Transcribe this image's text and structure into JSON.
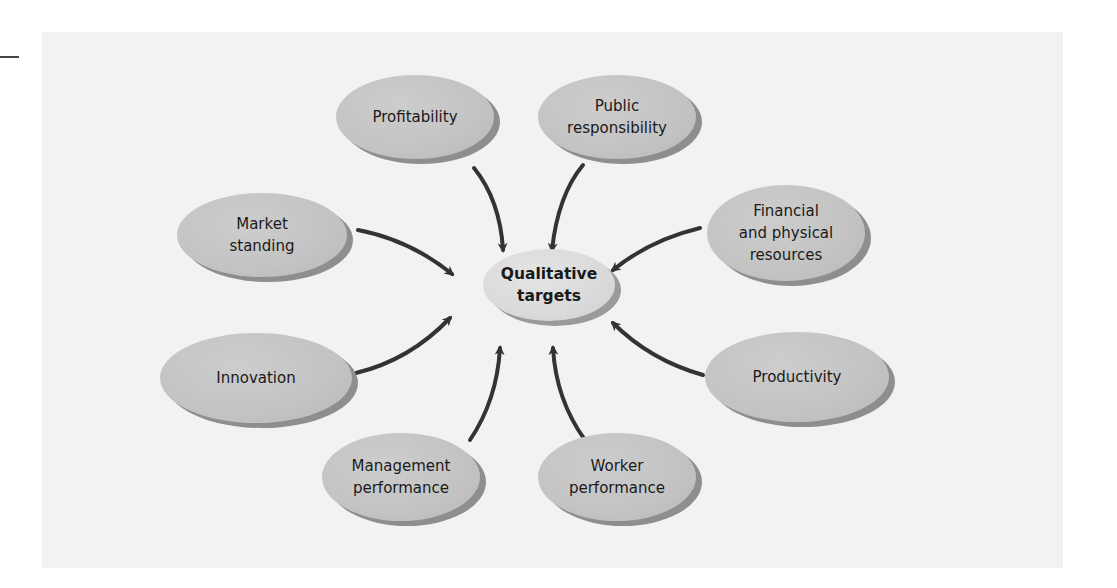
{
  "diagram": {
    "type": "hub-and-spoke",
    "center": {
      "label": "Qualitative\ntargets",
      "x": 549,
      "y": 285,
      "w": 132,
      "h": 72
    },
    "nodes": [
      {
        "id": "profitability",
        "label": "Profitability",
        "x": 415,
        "y": 117,
        "w": 158,
        "h": 84
      },
      {
        "id": "public-responsibility",
        "label": "Public\nresponsibility",
        "x": 617,
        "y": 117,
        "w": 158,
        "h": 84
      },
      {
        "id": "market-standing",
        "label": "Market\nstanding",
        "x": 262,
        "y": 235,
        "w": 170,
        "h": 84
      },
      {
        "id": "financial-physical-resources",
        "label": "Financial\nand physical\nresources",
        "x": 786,
        "y": 233,
        "w": 158,
        "h": 96
      },
      {
        "id": "innovation",
        "label": "Innovation",
        "x": 256,
        "y": 378,
        "w": 192,
        "h": 90
      },
      {
        "id": "productivity",
        "label": "Productivity",
        "x": 797,
        "y": 377,
        "w": 184,
        "h": 90
      },
      {
        "id": "management-performance",
        "label": "Management\nperformance",
        "x": 401,
        "y": 477,
        "w": 158,
        "h": 88
      },
      {
        "id": "worker-performance",
        "label": "Worker\nperformance",
        "x": 617,
        "y": 477,
        "w": 158,
        "h": 88
      }
    ],
    "edges": [
      {
        "from": "profitability",
        "to": "center",
        "path": "M 474 168 Q 500 200 503 250"
      },
      {
        "from": "public-responsibility",
        "to": "center",
        "path": "M 583 165 Q 558 195 552 250"
      },
      {
        "from": "market-standing",
        "to": "center",
        "path": "M 358 230 Q 410 240 452 274"
      },
      {
        "from": "financial-physical-resources",
        "to": "center",
        "path": "M 700 228 Q 650 240 613 270"
      },
      {
        "from": "innovation",
        "to": "center",
        "path": "M 356 373 Q 410 360 450 318"
      },
      {
        "from": "productivity",
        "to": "center",
        "path": "M 703 375 Q 650 360 613 323"
      },
      {
        "from": "management-performance",
        "to": "center",
        "path": "M 470 440 Q 497 400 500 348"
      },
      {
        "from": "worker-performance",
        "to": "center",
        "path": "M 585 440 Q 556 400 553 348"
      }
    ],
    "colors": {
      "panel_bg": "#f2f2f0",
      "node_fill": "#c4c4c4",
      "node_shadow": "#8e8e8e",
      "center_fill": "#dcdcdc",
      "arrow": "#333333",
      "text": "#1a1a1a"
    }
  }
}
